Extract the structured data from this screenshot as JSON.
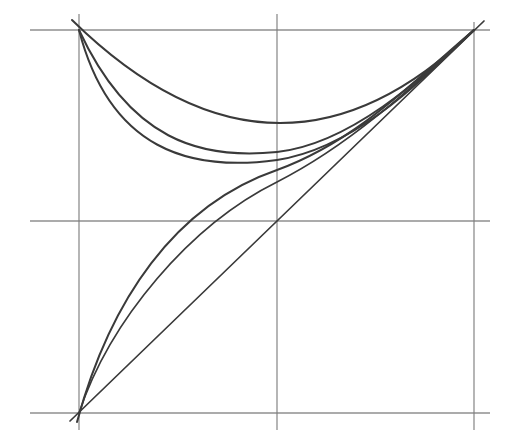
{
  "diagram": {
    "title": "",
    "background": "#ffffff",
    "grid_color": "#7a7a7a",
    "curve_color": "#3a3a3a",
    "grid": {
      "vertical_lines_x": [
        79,
        277,
        474
      ],
      "horizontal_lines_y": [
        30,
        221,
        413
      ],
      "extent": {
        "x_min": 30,
        "x_max": 490,
        "y_min": 14,
        "y_max": 430
      }
    },
    "key_points": [
      {
        "name": "bottom-left",
        "x": 79,
        "y": 413
      },
      {
        "name": "top-left",
        "x": 79,
        "y": 30
      },
      {
        "name": "top-right",
        "x": 474,
        "y": 30
      },
      {
        "name": "center",
        "x": 277,
        "y": 221
      }
    ],
    "curves": [
      {
        "name": "diagonal-line",
        "from": "bottom-left",
        "to": "top-right",
        "path": "M70,421 L484,21"
      },
      {
        "name": "lower-curve-1",
        "from": "bottom-left",
        "to": "top-right",
        "path": "M77,422 C110,300 175,205 277,170 C360,140 420,75 474,30"
      },
      {
        "name": "lower-curve-2",
        "from": "bottom-left",
        "to": "top-right",
        "path": "M79,413 C110,320 190,225 277,182 C360,140 430,70 474,30"
      },
      {
        "name": "upper-curve-1",
        "from": "top-left",
        "to": "top-right",
        "path": "M72,20 Q277,221 474,30"
      },
      {
        "name": "upper-curve-2",
        "from": "top-left",
        "to": "top-right",
        "path": "M79,30 C130,140 200,160 277,152 C350,144 420,80 474,30"
      },
      {
        "name": "upper-curve-3",
        "from": "top-left",
        "to": "top-right",
        "path": "M79,30 C110,150 190,172 277,160 C355,148 420,82 474,30"
      }
    ]
  }
}
